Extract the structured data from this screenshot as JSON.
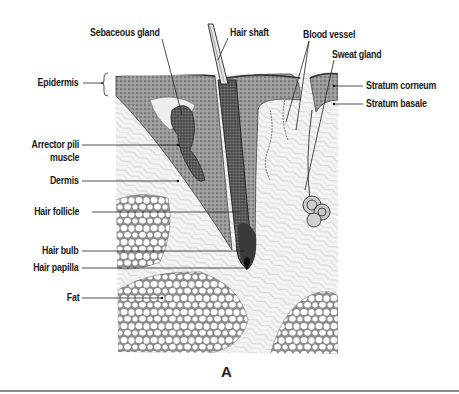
{
  "figure": {
    "caption": "A",
    "colors": {
      "ink": "#1a1a1a",
      "tissue_dark": "#555555",
      "tissue_light": "#d9d9d9",
      "rule": "#8a8a8a"
    }
  },
  "labels": {
    "left": [
      {
        "id": "epidermis",
        "text": "Epidermis"
      },
      {
        "id": "arrector_pili_1",
        "text": "Arrector pili"
      },
      {
        "id": "arrector_pili_2",
        "text": "muscle"
      },
      {
        "id": "dermis",
        "text": "Dermis"
      },
      {
        "id": "hair_follicle",
        "text": "Hair follicle"
      },
      {
        "id": "hair_bulb",
        "text": "Hair bulb"
      },
      {
        "id": "hair_papilla",
        "text": "Hair papilla"
      },
      {
        "id": "fat",
        "text": "Fat"
      }
    ],
    "top": [
      {
        "id": "sebaceous_gland",
        "text": "Sebaceous gland"
      },
      {
        "id": "hair_shaft",
        "text": "Hair shaft"
      },
      {
        "id": "blood_vessel",
        "text": "Blood vessel"
      },
      {
        "id": "sweat_gland",
        "text": "Sweat gland"
      }
    ],
    "right": [
      {
        "id": "stratum_corneum",
        "text": "Stratum corneum"
      },
      {
        "id": "stratum_basale",
        "text": "Stratum basale"
      }
    ]
  }
}
